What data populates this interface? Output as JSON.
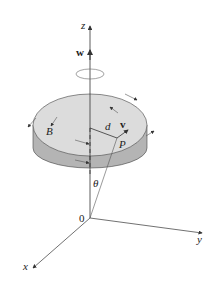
{
  "figure": {
    "type": "rotating disk with angular velocity vector",
    "labels": {
      "z_axis": "z",
      "y_axis": "y",
      "x_axis": "x",
      "origin": "0",
      "angular_velocity": "w",
      "velocity": "v",
      "distance": "d",
      "point": "P",
      "body": "B",
      "angle": "θ"
    },
    "colors": {
      "disk_top": "#dcdcdc",
      "disk_side": "#b4b4b4",
      "lines": "#333333",
      "background": "#ffffff"
    }
  }
}
